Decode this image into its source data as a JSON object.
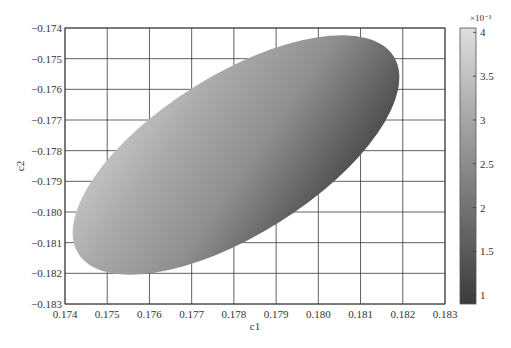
{
  "chart_data": {
    "type": "heatmap",
    "title": "",
    "xlabel": "c1",
    "ylabel": "c2",
    "xlim": [
      0.174,
      0.183
    ],
    "ylim": [
      -0.183,
      -0.174
    ],
    "grid": true,
    "x_ticks": [
      "0.174",
      "0.175",
      "0.176",
      "0.177",
      "0.178",
      "0.179",
      "0.180",
      "0.181",
      "0.182",
      "0.183"
    ],
    "y_ticks": [
      "-0.174",
      "-0.175",
      "-0.176",
      "-0.177",
      "-0.178",
      "-0.179",
      "-0.180",
      "-0.181",
      "-0.182",
      "-0.183"
    ],
    "shape": {
      "kind": "filled-ellipse",
      "center": [
        0.17815,
        -0.17805
      ],
      "approx_extent_c1": [
        0.17425,
        0.18205
      ],
      "approx_extent_c2": [
        -0.18215,
        -0.1741
      ],
      "orientation": "tilted upward to the right (positive correlation)",
      "shading": "light gray along upper-left rim, darkening toward the lower-right rim"
    },
    "colorbar": {
      "label_exponent": "×10⁻³",
      "ticks": [
        "1",
        "1.5",
        "2",
        "2.5",
        "3",
        "3.5",
        "4"
      ],
      "range": [
        0.9,
        4.05
      ],
      "colormap": "gray (dark = low, light = high)",
      "color_low": "#3c3c3c",
      "color_high": "#dcdcdc"
    }
  }
}
